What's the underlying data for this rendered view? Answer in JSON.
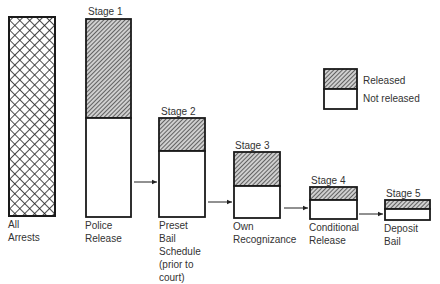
{
  "diagram": {
    "type": "flow-bar-diagram",
    "all_arrests": {
      "label_line1": "All",
      "label_line2": "Arrests",
      "pattern": "crosshatch"
    },
    "stages": [
      {
        "stage": "Stage 1",
        "label_lines": [
          "Police",
          "Release"
        ],
        "x": 86,
        "w": 45,
        "top": 19,
        "split": 118,
        "bottom": 217
      },
      {
        "stage": "Stage 2",
        "label_lines": [
          "Preset",
          "Bail",
          "Schedule",
          "(prior to",
          "court)"
        ],
        "x": 159,
        "w": 46,
        "top": 118,
        "split": 151,
        "bottom": 217
      },
      {
        "stage": "Stage 3",
        "label_lines": [
          "Own",
          "Recognizance"
        ],
        "x": 234,
        "w": 46,
        "top": 152,
        "split": 186,
        "bottom": 218
      },
      {
        "stage": "Stage 4",
        "label_lines": [
          "Conditional",
          "Release"
        ],
        "x": 310,
        "w": 47,
        "top": 187,
        "split": 200,
        "bottom": 219
      },
      {
        "stage": "Stage 5",
        "label_lines": [
          "Deposit",
          "Bail"
        ],
        "x": 385,
        "w": 45,
        "top": 200,
        "split": 209,
        "bottom": 220
      }
    ],
    "legend": {
      "released": "Released",
      "not_released": "Not released"
    },
    "colors": {
      "stroke": "#1a1a1a",
      "hatch": "#333333",
      "fill": "#ffffff"
    }
  }
}
